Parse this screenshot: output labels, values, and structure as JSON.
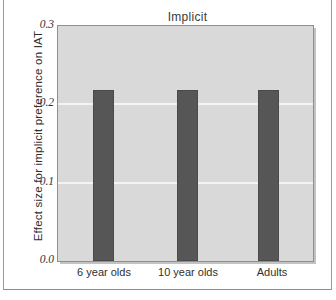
{
  "chart_data": {
    "type": "bar",
    "title": "Implicit",
    "xlabel": "",
    "ylabel": "Effect size for implicit preference on IAT",
    "categories": [
      "6 year olds",
      "10 year olds",
      "Adults"
    ],
    "values": [
      0.218,
      0.218,
      0.218
    ],
    "ylim": [
      0.0,
      0.3
    ],
    "yticks": [
      "0.3",
      "0.2",
      "0.1",
      "0.0"
    ],
    "ytick_values": [
      0.3,
      0.2,
      0.1,
      0.0
    ],
    "grid": true,
    "gridlines_at": [
      0.2,
      0.1
    ],
    "legend": "none",
    "series": [
      {
        "name": "Implicit preference",
        "values": [
          0.218,
          0.218,
          0.218
        ]
      }
    ],
    "colors": {
      "bar": "#565656",
      "plot_background": "#d9d9d9",
      "gridline": "#f4f4f4",
      "axis_frame": "#8f8f8f",
      "page_background": "#ffffff",
      "text": "#2f2f2f"
    }
  }
}
